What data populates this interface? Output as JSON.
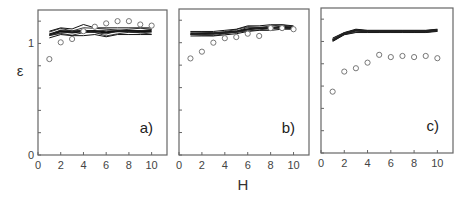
{
  "figure": {
    "ylabel": "ε",
    "xlabel": "H"
  },
  "chart_data": [
    {
      "type": "line",
      "panel_label": "a)",
      "xlabel": "H",
      "ylabel": "ε",
      "xlim": [
        0,
        11
      ],
      "ylim": [
        0,
        1.3
      ],
      "x_ticks": [
        0,
        2,
        4,
        6,
        8,
        10
      ],
      "y_tick_labels": [
        "0",
        "1"
      ],
      "x": [
        1,
        2,
        3,
        4,
        5,
        6,
        7,
        8,
        9,
        10
      ],
      "series": [
        {
          "name": "simulations (band, min)",
          "style": "lines",
          "values": [
            1.05,
            1.08,
            1.07,
            1.07,
            1.08,
            1.06,
            1.08,
            1.08,
            1.08,
            1.08
          ]
        },
        {
          "name": "simulations (band, mid)",
          "style": "lines",
          "values": [
            1.08,
            1.11,
            1.1,
            1.11,
            1.11,
            1.1,
            1.11,
            1.11,
            1.11,
            1.11
          ]
        },
        {
          "name": "simulations (band, max)",
          "style": "lines",
          "values": [
            1.11,
            1.14,
            1.13,
            1.17,
            1.14,
            1.14,
            1.14,
            1.14,
            1.14,
            1.14
          ]
        },
        {
          "name": "data",
          "style": "circles",
          "values": [
            0.86,
            1.01,
            1.04,
            1.11,
            1.15,
            1.18,
            1.2,
            1.2,
            1.17,
            1.16
          ]
        }
      ]
    },
    {
      "type": "line",
      "panel_label": "b)",
      "xlabel": "H",
      "ylabel": "ε",
      "xlim": [
        0,
        11
      ],
      "ylim": [
        0,
        1.3
      ],
      "x_ticks": [
        0,
        2,
        4,
        6,
        8,
        10
      ],
      "y_tick_labels": [],
      "x": [
        1,
        2,
        3,
        4,
        5,
        6,
        7,
        8,
        9,
        10
      ],
      "series": [
        {
          "name": "simulations (band, min)",
          "style": "lines",
          "values": [
            1.06,
            1.06,
            1.06,
            1.07,
            1.08,
            1.1,
            1.11,
            1.11,
            1.12,
            1.12
          ]
        },
        {
          "name": "simulations (band, mid)",
          "style": "lines",
          "values": [
            1.08,
            1.08,
            1.08,
            1.09,
            1.1,
            1.12,
            1.13,
            1.13,
            1.14,
            1.13
          ]
        },
        {
          "name": "simulations (band, max)",
          "style": "lines",
          "values": [
            1.1,
            1.1,
            1.1,
            1.11,
            1.12,
            1.15,
            1.15,
            1.16,
            1.16,
            1.15
          ]
        },
        {
          "name": "data",
          "style": "circles",
          "values": [
            0.86,
            0.92,
            1.0,
            1.04,
            1.05,
            1.08,
            1.06,
            1.13,
            1.13,
            1.12
          ]
        }
      ]
    },
    {
      "type": "line",
      "panel_label": "c)",
      "xlabel": "H",
      "ylabel": "ε",
      "xlim": [
        0,
        11
      ],
      "ylim": [
        0,
        1.3
      ],
      "x_ticks": [
        0,
        2,
        4,
        6,
        8,
        10
      ],
      "y_tick_labels": [],
      "x": [
        1,
        2,
        3,
        4,
        5,
        6,
        7,
        8,
        9,
        10
      ],
      "series": [
        {
          "name": "simulations (band, min)",
          "style": "lines",
          "values": [
            1.0,
            1.06,
            1.08,
            1.08,
            1.08,
            1.08,
            1.08,
            1.08,
            1.08,
            1.09
          ]
        },
        {
          "name": "simulations (band, mid)",
          "style": "lines",
          "values": [
            1.01,
            1.07,
            1.1,
            1.09,
            1.09,
            1.09,
            1.09,
            1.09,
            1.09,
            1.1
          ]
        },
        {
          "name": "simulations (band, max)",
          "style": "lines",
          "values": [
            1.03,
            1.08,
            1.11,
            1.1,
            1.1,
            1.1,
            1.1,
            1.1,
            1.1,
            1.11
          ]
        },
        {
          "name": "data",
          "style": "circles",
          "values": [
            0.55,
            0.73,
            0.76,
            0.81,
            0.88,
            0.86,
            0.87,
            0.86,
            0.87,
            0.85
          ]
        }
      ]
    }
  ]
}
